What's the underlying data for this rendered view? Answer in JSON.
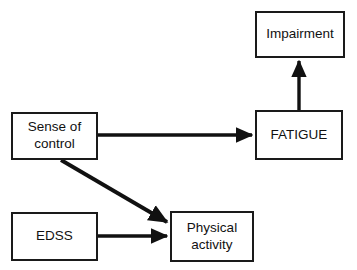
{
  "diagram": {
    "background_color": "#ffffff",
    "stroke_color": "#1a1a1a",
    "nodes": [
      {
        "id": "impairment",
        "label": "Impairment"
      },
      {
        "id": "fatigue",
        "label": "FATIGUE"
      },
      {
        "id": "sense_of_control",
        "label": "Sense of\ncontrol"
      },
      {
        "id": "edss",
        "label": "EDSS"
      },
      {
        "id": "physical_activity",
        "label": "Physical\nactivity"
      }
    ],
    "edges": [
      {
        "id": "fatigue_to_impairment",
        "from": "FATIGUE",
        "to": "Impairment",
        "direction": "up",
        "arrowhead": "filled"
      },
      {
        "id": "sense_of_control_to_fatigue",
        "from": "Sense of control",
        "to": "FATIGUE",
        "direction": "right",
        "arrowhead": "filled"
      },
      {
        "id": "sense_of_control_to_physical_activity",
        "from": "Sense of control",
        "to": "Physical activity",
        "direction": "diagonal-down-right",
        "arrowhead": "filled"
      },
      {
        "id": "edss_to_physical_activity",
        "from": "EDSS",
        "to": "Physical activity",
        "direction": "right",
        "arrowhead": "filled"
      }
    ]
  }
}
